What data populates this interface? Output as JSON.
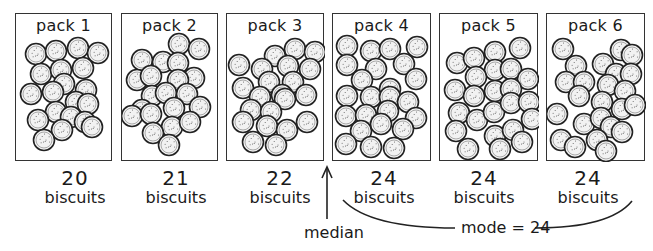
{
  "packs": [
    {
      "label": "pack 1",
      "count": "20",
      "unit": "biscuits"
    },
    {
      "label": "pack 2",
      "count": "21",
      "unit": "biscuits"
    },
    {
      "label": "pack 3",
      "count": "22",
      "unit": "biscuits"
    },
    {
      "label": "pack 4",
      "count": "24",
      "unit": "biscuits"
    },
    {
      "label": "pack 5",
      "count": "24",
      "unit": "biscuits"
    },
    {
      "label": "pack 6",
      "count": "24",
      "unit": "biscuits"
    }
  ],
  "annotations": {
    "median_label": "median",
    "mode_label": "mode = 24"
  },
  "colors": {
    "outline": "#222222",
    "biscuit_fill": "#f2f2f2",
    "background": "#ffffff"
  }
}
